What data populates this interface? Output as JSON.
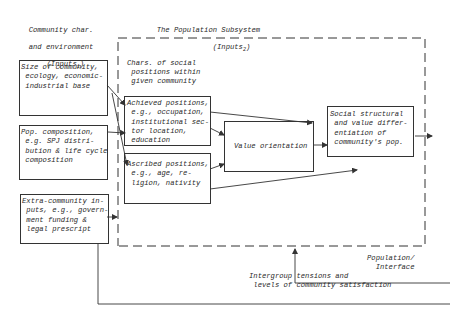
{
  "diagram": {
    "headers": {
      "community_inputs": {
        "line1": "Community char.",
        "line2": "and environment",
        "line3": "(Inputs",
        "line3_sub": "1",
        "line3_end": ")"
      },
      "population_subsystem": {
        "line1": "The Population Subsystem",
        "line2": "(Inputs",
        "line2_sub": "2",
        "line2_end": ")"
      },
      "chars_social_positions": "Chars. of social\n positions within\n given community",
      "population_interface": "Population/\n  Interface",
      "intergroup_tensions": "Intergroup tensions and\n levels of community satisfaction"
    },
    "boxes": {
      "size_of_community": "Size of community,\n ecology, economic-\n industrial base",
      "pop_composition": "Pop. composition,\n e.g. SPJ distri-\n bution & life cycle\n composition",
      "extra_community": "Extra-community in-\n puts, e.g., govern-\n ment funding &\n legal prescript",
      "achieved_positions": "Achieved positions,\n e.g., occupation,\n institutional sec-\n tor location,\n education",
      "ascribed_positions": "Ascribed positions,\n e.g., age, re-\n ligion, nativity",
      "value_orientation": "Value orientation",
      "social_structural": "Social structural\n and value differ-\n entiation of\n community's pop."
    }
  }
}
